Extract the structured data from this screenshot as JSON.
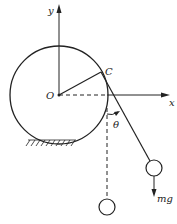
{
  "diagram": {
    "labels": {
      "y_axis": "y",
      "x_axis": "x",
      "origin": "O",
      "contact_point": "C",
      "angle": "θ",
      "weight": "mg"
    }
  }
}
